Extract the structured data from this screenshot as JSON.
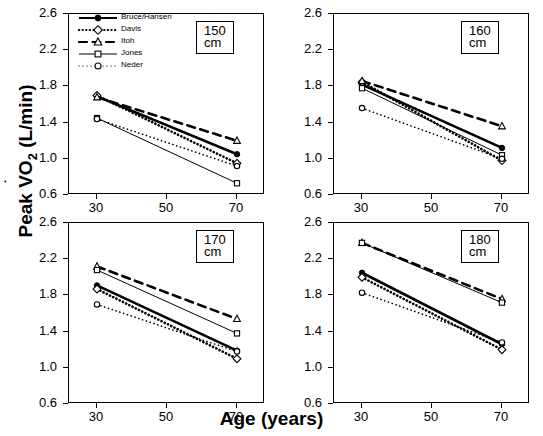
{
  "figure": {
    "xlabel": "Age (years)",
    "ylabel_pre": "Peak V",
    "ylabel_sub": "2",
    "ylabel_post": "O",
    "ylabel_unit": " (L/min)",
    "ylabel_full": "Peak VO2 (L/min)"
  },
  "legend": {
    "position": "top-left-panel-1",
    "items": [
      {
        "name": "Bruce/Hansen",
        "marker": "filled-circle",
        "line": "solid-bold",
        "color": "#000000"
      },
      {
        "name": "Davis",
        "marker": "open-diamond",
        "line": "dotted-bold",
        "color": "#000000"
      },
      {
        "name": "Itoh",
        "marker": "open-triangle",
        "line": "dashed-bold",
        "color": "#000000"
      },
      {
        "name": "Jones",
        "marker": "open-square",
        "line": "solid-thin",
        "color": "#000000"
      },
      {
        "name": "Neder",
        "marker": "open-circle",
        "line": "dotted-thin",
        "color": "#000000"
      }
    ]
  },
  "axes": {
    "x": {
      "ticks": [
        30,
        50,
        70
      ],
      "tick_labels": [
        "30",
        "50",
        "70"
      ],
      "min": 22,
      "max": 78
    },
    "y": {
      "ticks": [
        0.6,
        1.0,
        1.4,
        1.8,
        2.2,
        2.6
      ],
      "tick_labels": [
        "0.6",
        "1.0",
        "1.4",
        "1.8",
        "2.2",
        "2.6"
      ],
      "min": 0.6,
      "max": 2.6
    }
  },
  "chart_data": {
    "type": "line",
    "title": "",
    "xlabel": "Age (years)",
    "ylabel": "Peak VO2 (L/min)",
    "xlim": [
      22,
      78
    ],
    "ylim": [
      0.6,
      2.6
    ],
    "grid": false,
    "x": [
      30,
      70
    ],
    "panels": [
      {
        "tag": "150 cm",
        "series": [
          {
            "name": "Bruce/Hansen",
            "values": [
              1.69,
              1.05
            ]
          },
          {
            "name": "Davis",
            "values": [
              1.7,
              0.95
            ]
          },
          {
            "name": "Itoh",
            "values": [
              1.68,
              1.2
            ]
          },
          {
            "name": "Jones",
            "values": [
              1.45,
              0.73
            ]
          },
          {
            "name": "Neder",
            "values": [
              1.44,
              0.92
            ]
          }
        ]
      },
      {
        "tag": "160 cm",
        "series": [
          {
            "name": "Bruce/Hansen",
            "values": [
              1.82,
              1.12
            ]
          },
          {
            "name": "Davis",
            "values": [
              1.85,
              0.98
            ]
          },
          {
            "name": "Itoh",
            "values": [
              1.86,
              1.36
            ]
          },
          {
            "name": "Jones",
            "values": [
              1.78,
              1.04
            ]
          },
          {
            "name": "Neder",
            "values": [
              1.56,
              1.0
            ]
          }
        ]
      },
      {
        "tag": "170 cm",
        "series": [
          {
            "name": "Bruce/Hansen",
            "values": [
              1.91,
              1.19
            ]
          },
          {
            "name": "Davis",
            "values": [
              1.87,
              1.1
            ]
          },
          {
            "name": "Itoh",
            "values": [
              2.12,
              1.54
            ]
          },
          {
            "name": "Jones",
            "values": [
              2.08,
              1.38
            ]
          },
          {
            "name": "Neder",
            "values": [
              1.7,
              1.18
            ]
          }
        ]
      },
      {
        "tag": "180 cm",
        "series": [
          {
            "name": "Bruce/Hansen",
            "values": [
              2.05,
              1.26
            ]
          },
          {
            "name": "Davis",
            "values": [
              2.0,
              1.2
            ]
          },
          {
            "name": "Itoh",
            "values": [
              2.38,
              1.76
            ]
          },
          {
            "name": "Jones",
            "values": [
              2.38,
              1.72
            ]
          },
          {
            "name": "Neder",
            "values": [
              1.83,
              1.28
            ]
          }
        ]
      }
    ]
  }
}
